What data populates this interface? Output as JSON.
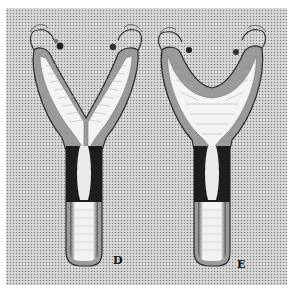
{
  "figure": {
    "background_color": "#ffffff",
    "panel_color": "#cfcfcf",
    "stipple_color": "#8a8a8a",
    "outline_color": "#2a2a2a",
    "dark_band_color": "#1a1a1a",
    "lumen_color": "#ffffff",
    "specimens": [
      {
        "id": "D",
        "label": "D",
        "shape": "Y-shaped (narrow fundus, deep cleft)"
      },
      {
        "id": "E",
        "label": "E",
        "shape": "V/U-shaped (broad fundus, shallow arch)"
      }
    ]
  }
}
